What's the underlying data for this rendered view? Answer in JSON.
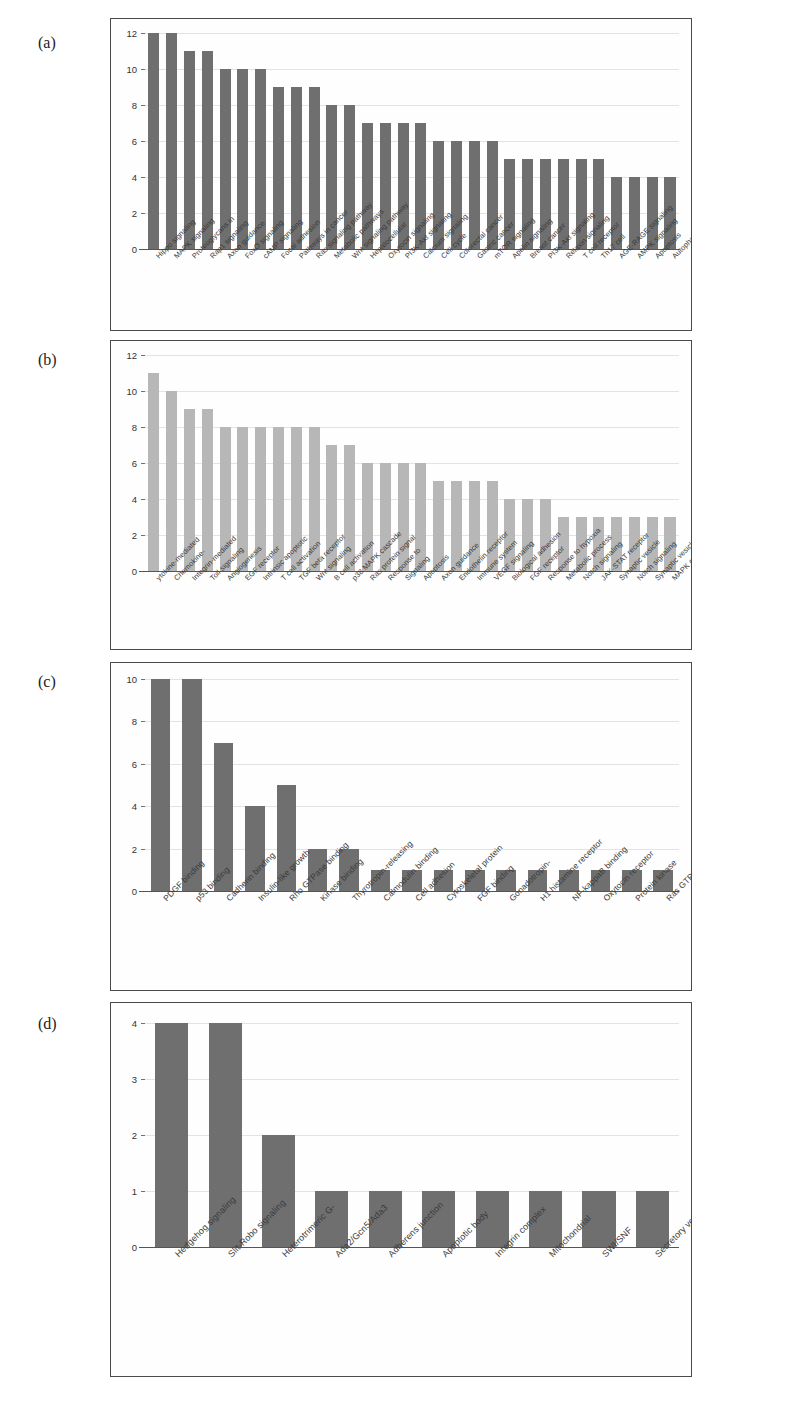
{
  "figure": {
    "panel_labels": [
      "(a)",
      "(b)",
      "(c)",
      "(d)"
    ],
    "bar_color_dark": "#6f6f6f",
    "bar_color_light": "#b7b7b7",
    "grid_color": "#e3e3e3"
  },
  "chart_data": [
    {
      "type": "bar",
      "panel": "(a)",
      "title": "",
      "xlabel": "",
      "ylabel": "",
      "ylim": [
        0,
        12
      ],
      "yticks": [
        0,
        2,
        4,
        6,
        8,
        10,
        12
      ],
      "grid": true,
      "legend": "none",
      "bar_color": "#6f6f6f",
      "categories": [
        "Hippo signaling",
        "MAPK signaling",
        "Proteoglycans in",
        "Rap1 signaling",
        "Axon guidance",
        "FoxO signaling",
        "cAMP signaling",
        "Focal adhesion",
        "Pathways in cancer",
        "Ras signaling pathway",
        "Metabolic pathways",
        "Wnt signaling pathway",
        "Hepatocellular",
        "Oxytocin signaling",
        "PI3K-Akt signaling",
        "Calcium signaling",
        "Cell cycle",
        "Colorectal cancer",
        "Gastric cancer",
        "mTOR signaling",
        "Apelin signaling",
        "Breast cancer",
        "PI3K-Akt signaling",
        "Relaxin signaling",
        "T cell receptor",
        "Th17 cell",
        "AGE-RAGE signaling",
        "AMPK signaling",
        "Apoptosis",
        "Autophagy"
      ],
      "values": [
        12,
        12,
        11,
        11,
        10,
        10,
        10,
        9,
        9,
        9,
        8,
        8,
        7,
        7,
        7,
        7,
        6,
        6,
        6,
        6,
        5,
        5,
        5,
        5,
        5,
        5,
        4,
        4,
        4,
        4
      ]
    },
    {
      "type": "bar",
      "panel": "(b)",
      "title": "",
      "xlabel": "",
      "ylabel": "",
      "ylim": [
        0,
        12
      ],
      "yticks": [
        0,
        2,
        4,
        6,
        8,
        10,
        12
      ],
      "grid": true,
      "legend": "none",
      "bar_color": "#b7b7b7",
      "categories": [
        "ytokine-mediated",
        "Chemokine-",
        "Integrin-mediated",
        "Toll signaling",
        "Angiogenesis",
        "EGF receptor",
        "Intrinsic apoptotic",
        "T cell activation",
        "TGF beta receptor",
        "Wnt signaling",
        "B cell activation",
        "p38 MAPK cascade",
        "Ras protein signal",
        "Response to",
        "Signaling",
        "Apoptosis",
        "Axon guidance",
        "Endothelin receptor",
        "Immune system",
        "VEGF signaling",
        "Biological adhesion",
        "FGF receptor",
        "Response to hypoxia",
        "Metabolic process",
        "Notch signaling",
        "JAK-STAT receptor",
        "Synaptic vesicle",
        "Notch signaling",
        "Synaptic vesicle",
        "MAPK cascade"
      ],
      "values": [
        11,
        10,
        9,
        9,
        8,
        8,
        8,
        8,
        8,
        8,
        7,
        7,
        6,
        6,
        6,
        6,
        5,
        5,
        5,
        5,
        4,
        4,
        4,
        3,
        3,
        3,
        3,
        3,
        3,
        3
      ]
    },
    {
      "type": "bar",
      "panel": "(c)",
      "title": "",
      "xlabel": "",
      "ylabel": "",
      "ylim": [
        0,
        10
      ],
      "yticks": [
        0,
        2,
        4,
        6,
        8,
        10
      ],
      "grid": true,
      "legend": "none",
      "bar_color": "#6f6f6f",
      "categories": [
        "PDGF binding",
        "p53 binding",
        "Cadherin binding",
        "Insulin-like growth",
        "Rho GTPase binding",
        "Kinase binding",
        "Thyrotropin-releasing",
        "Calmodulin binding",
        "Cell adhesion",
        "Cytoskeletal protein",
        "FGF binding",
        "Gonadotropin-",
        "H1 histamine receptor",
        "NF-kappaB binding",
        "Oxytocin receptor",
        "Protein kinase",
        "Ras GTPase binding"
      ],
      "values": [
        10,
        10,
        7,
        4,
        5,
        2,
        2,
        1,
        1,
        1,
        1,
        1,
        1,
        1,
        1,
        1,
        1
      ]
    },
    {
      "type": "bar",
      "panel": "(d)",
      "title": "",
      "xlabel": "",
      "ylabel": "",
      "ylim": [
        0,
        4
      ],
      "yticks": [
        0,
        1,
        2,
        3,
        4
      ],
      "grid": true,
      "legend": "none",
      "bar_color": "#6f6f6f",
      "categories": [
        "Hedgehog signaling",
        "Slit-Robo signaling",
        "Heterotrimeric G-",
        "Ada2/Gcn5/Ada3",
        "Adherens junction",
        "Apoptotic body",
        "Integrin complex",
        "Mitochondrial",
        "SWI/SNF",
        "Secretory vesicle"
      ],
      "values": [
        4,
        4,
        2,
        1,
        1,
        1,
        1,
        1,
        1,
        1
      ]
    }
  ]
}
